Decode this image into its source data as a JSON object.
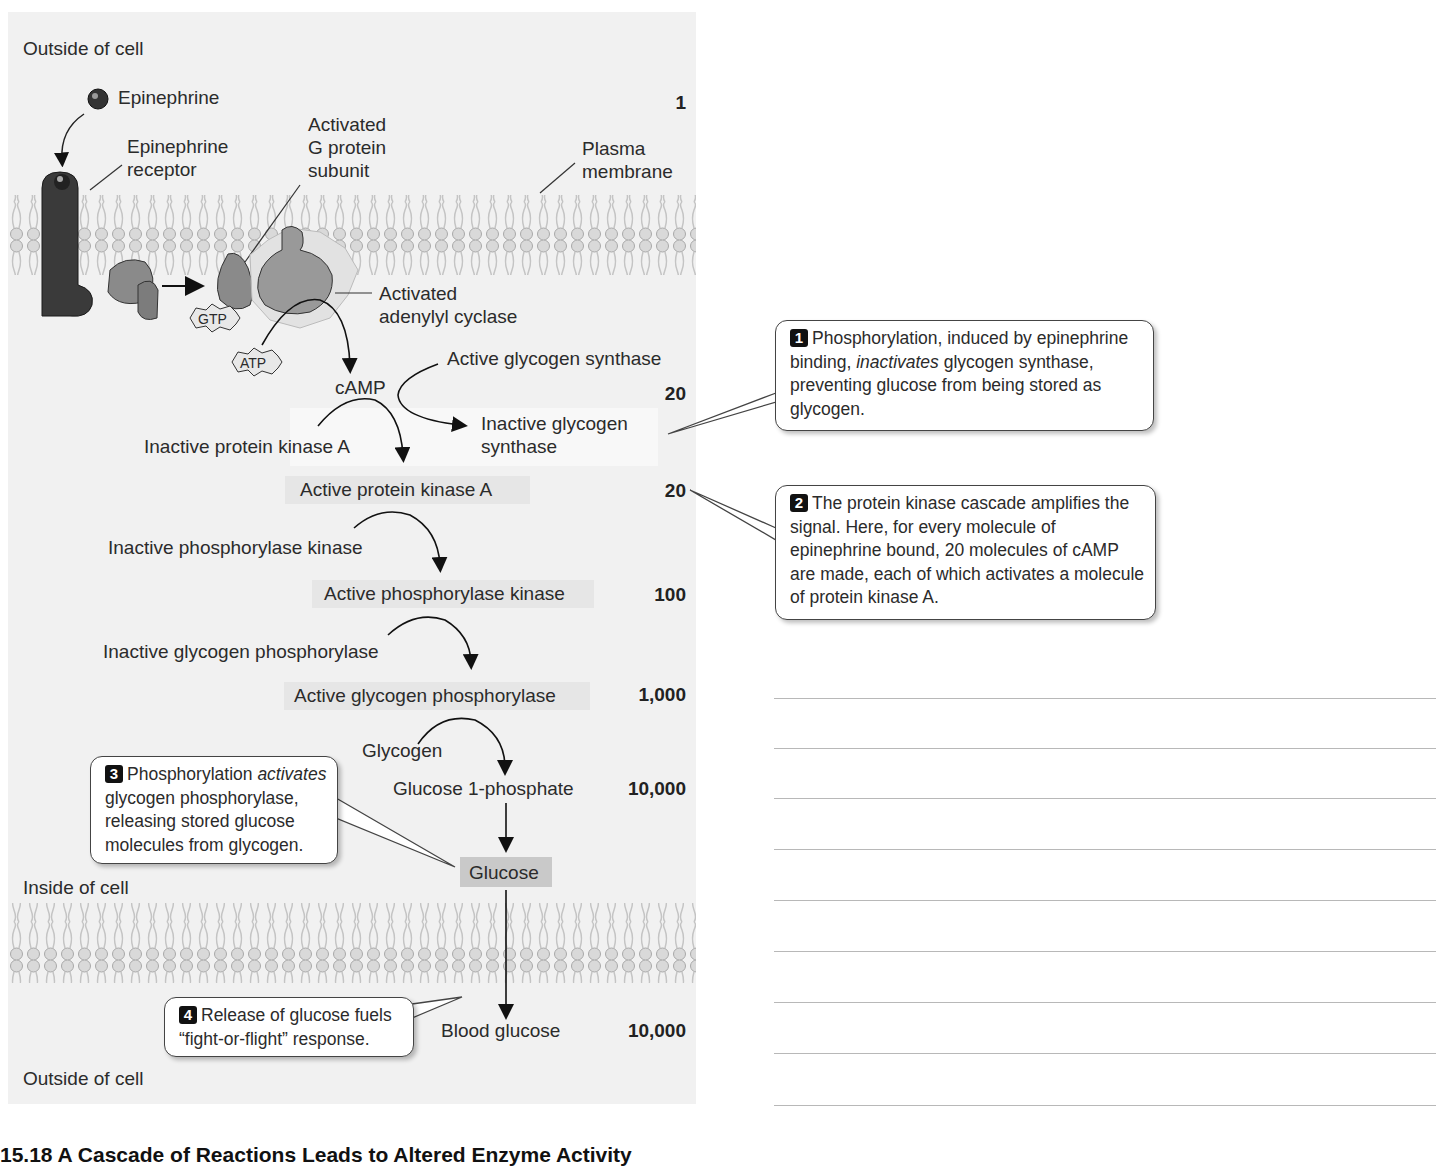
{
  "figure": {
    "caption": "15.18  A Cascade of Reactions Leads to Altered Enzyme Activity"
  },
  "regions": {
    "outside_top": "Outside of cell",
    "inside": "Inside of cell",
    "outside_bottom": "Outside of cell"
  },
  "labels": {
    "epinephrine": "Epinephrine",
    "receptor_line1": "Epinephrine",
    "receptor_line2": "receptor",
    "gprotein_line1": "Activated",
    "gprotein_line2": "G protein",
    "gprotein_line3": "subunit",
    "membrane_line1": "Plasma",
    "membrane_line2": "membrane",
    "cyclase_line1": "Activated",
    "cyclase_line2": "adenylyl cyclase",
    "gtp": "GTP",
    "atp": "ATP",
    "camp": "cAMP",
    "active_glycogen_synthase": "Active glycogen synthase",
    "inactive_glycogen_synthase_line1": "Inactive glycogen",
    "inactive_glycogen_synthase_line2": "synthase",
    "inactive_pka": "Inactive protein kinase A",
    "active_pka": "Active protein kinase A",
    "inactive_phk": "Inactive phosphorylase kinase",
    "active_phk": "Active phosphorylase kinase",
    "inactive_gp": "Inactive glycogen phosphorylase",
    "active_gp": "Active glycogen phosphorylase",
    "glycogen": "Glycogen",
    "g1p": "Glucose 1-phosphate",
    "glucose": "Glucose",
    "blood_glucose": "Blood glucose"
  },
  "amplification": {
    "epinephrine": "1",
    "camp": "20",
    "pka": "20",
    "phk": "100",
    "gp": "1,000",
    "g1p": "10,000",
    "blood_glucose": "10,000"
  },
  "callouts": [
    {
      "badge": "1",
      "pre": "Phosphorylation, induced by epinephrine binding, ",
      "em": "inactivates",
      "post": " glycogen synthase, preventing glucose from being stored as glycogen."
    },
    {
      "badge": "2",
      "pre": "The protein kinase cascade amplifies the signal. Here, for every molecule of epinephrine bound, 20 molecules of cAMP are made, each of which activates a molecule of protein kinase A.",
      "em": "",
      "post": ""
    },
    {
      "badge": "3",
      "pre": "Phosphorylation ",
      "em": "activates",
      "post": " glycogen phosphorylase, releasing stored glucose molecules from glycogen."
    },
    {
      "badge": "4",
      "pre": "Release of glucose fuels “fight-or-flight” response.",
      "em": "",
      "post": ""
    }
  ],
  "notes_area": {
    "ruled_line_count": 9
  },
  "colors": {
    "panel_bg": "#f1f1f1",
    "highlight_bg": "#e6e6e6",
    "glucose_bg": "#c9c9c9",
    "receptor": "#333333",
    "protein": "#8a8a8a"
  }
}
